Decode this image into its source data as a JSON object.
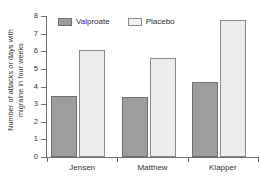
{
  "chart_data": {
    "type": "bar",
    "title": "",
    "xlabel": "",
    "ylabel": "Number of attacks or days with migraine in four weeks",
    "ylabel_lines": [
      "Number of attacks or days with",
      "migraine in four weeks"
    ],
    "categories": [
      "Jensen",
      "Matthew",
      "Klapper"
    ],
    "series": [
      {
        "name": "Valproate",
        "color": "#9d9d9d",
        "values": [
          3.45,
          3.4,
          4.25
        ]
      },
      {
        "name": "Placebo",
        "color": "#ededed",
        "values": [
          6.05,
          5.6,
          7.8
        ]
      }
    ],
    "ylim": [
      0,
      8
    ],
    "yticks": [
      0,
      1,
      2,
      3,
      4,
      5,
      6,
      7,
      8
    ],
    "ytick_labels": [
      "0",
      "1",
      "2",
      "3",
      "4",
      "5",
      "6",
      "7",
      "8"
    ],
    "grid": false,
    "legend_position": "top-left-inside"
  },
  "legend": {
    "items": [
      {
        "label": "Valproate",
        "swatch": "valproate-swatch"
      },
      {
        "label": "Placebo",
        "swatch": "placebo-swatch"
      }
    ]
  },
  "colors": {
    "valproate": "#9d9d9d",
    "placebo": "#ededed",
    "axis": "#6e6e6e",
    "text": "#2e2e2e",
    "background": "#ffffff"
  }
}
